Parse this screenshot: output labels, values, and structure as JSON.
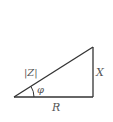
{
  "diagram": {
    "type": "impedance-triangle",
    "labels": {
      "hypotenuse": "|Z|",
      "angle": "φ",
      "vertical": "X",
      "base": "R"
    },
    "colors": {
      "line": "#333333",
      "text": "#555555",
      "background": "#ffffff"
    }
  }
}
